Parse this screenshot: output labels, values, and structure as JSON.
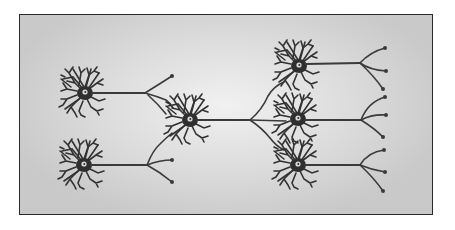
{
  "diagram": {
    "type": "neural-network-illustration",
    "colors": {
      "frame_border": "#2a2a2a",
      "background_center": "#f1f1f1",
      "background_edge": "#c9c9c9",
      "neuron": "#2f2f2f"
    },
    "neurons": [
      {
        "id": "input-top",
        "soma": [
          85,
          93
        ],
        "axon_end": [
          145,
          93
        ],
        "terminals": [
          [
            172,
            76
          ]
        ],
        "connects_to": "central"
      },
      {
        "id": "input-bottom",
        "soma": [
          84,
          165
        ],
        "axon_end": [
          147,
          165
        ],
        "terminals": [
          [
            172,
            160
          ],
          [
            172,
            182
          ]
        ],
        "connects_to": "central"
      },
      {
        "id": "central",
        "soma": [
          190,
          120
        ],
        "axon_end": [
          250,
          120
        ],
        "terminals": [],
        "connects_to": [
          "output-top",
          "output-middle",
          "output-bottom"
        ]
      },
      {
        "id": "output-top",
        "soma": [
          299,
          66
        ],
        "axon_end": [
          360,
          63
        ],
        "terminals": [
          [
            385,
            48
          ],
          [
            386,
            71
          ],
          [
            383,
            89
          ]
        ]
      },
      {
        "id": "output-middle",
        "soma": [
          298,
          119
        ],
        "axon_end": [
          361,
          120
        ],
        "terminals": [
          [
            385,
            97
          ],
          [
            386,
            115
          ],
          [
            383,
            137
          ]
        ]
      },
      {
        "id": "output-bottom",
        "soma": [
          298,
          165
        ],
        "axon_end": [
          360,
          165
        ],
        "terminals": [
          [
            384,
            150
          ],
          [
            385,
            172
          ],
          [
            383,
            191
          ]
        ]
      }
    ]
  }
}
